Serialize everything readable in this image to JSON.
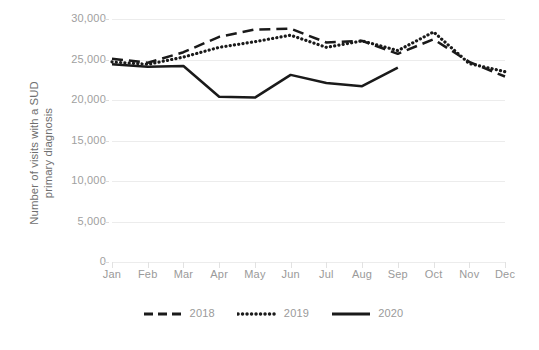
{
  "chart_data": {
    "type": "line",
    "title": "",
    "xlabel": "",
    "ylabel": "Number of visits with a SUD primary diagnosis",
    "ylabel_lines": [
      "Number of visits with a SUD",
      "primary diagnosis"
    ],
    "categories": [
      "Jan",
      "Feb",
      "Mar",
      "Apr",
      "May",
      "Jun",
      "Jul",
      "Aug",
      "Sep",
      "Oct",
      "Nov",
      "Dec"
    ],
    "ylim": [
      0,
      30000
    ],
    "yticks": [
      0,
      5000,
      10000,
      15000,
      20000,
      25000,
      30000
    ],
    "ytick_labels": [
      "0",
      "5,000",
      "10,000",
      "15,000",
      "20,000",
      "25,000",
      "30,000"
    ],
    "grid": true,
    "grid_axis": "y",
    "legend_position": "bottom",
    "series": [
      {
        "name": "2018",
        "style": "dashed",
        "color": "#1a1a1a",
        "values": [
          25100,
          24600,
          25900,
          27800,
          28700,
          28800,
          27100,
          27300,
          25700,
          27500,
          24700,
          22900
        ]
      },
      {
        "name": "2019",
        "style": "dotted",
        "color": "#1a1a1a",
        "values": [
          24700,
          24400,
          25300,
          26500,
          27200,
          28000,
          26500,
          27300,
          26100,
          28400,
          24500,
          23500
        ]
      },
      {
        "name": "2020",
        "style": "solid",
        "color": "#1a1a1a",
        "values": [
          24400,
          24100,
          24200,
          20400,
          20300,
          23100,
          22100,
          21700,
          24000,
          null,
          null,
          null
        ]
      }
    ]
  },
  "legend": {
    "items": [
      {
        "label": "2018",
        "swatch": "dashed-line-swatch"
      },
      {
        "label": "2019",
        "swatch": "dotted-line-swatch"
      },
      {
        "label": "2020",
        "swatch": "solid-line-swatch"
      }
    ]
  },
  "colors": {
    "line": "#1a1a1a",
    "gridline": "#ececec",
    "tick_text": "#a0a0a0",
    "axis_title": "#6f6f6f",
    "background": "#ffffff"
  }
}
